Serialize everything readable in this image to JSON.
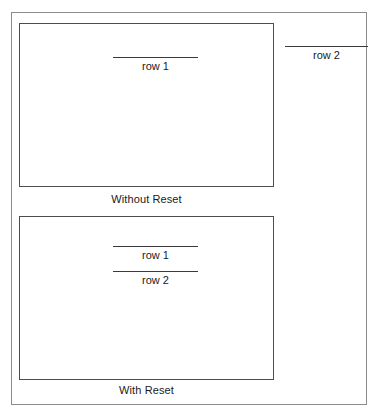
{
  "figure": {
    "panels": [
      {
        "id": "without-reset",
        "caption": "Without Reset",
        "rows_inside": [
          {
            "label": "row 1"
          }
        ],
        "rows_outside": [
          {
            "label": "row 2"
          }
        ]
      },
      {
        "id": "with-reset",
        "caption": "With Reset",
        "rows_inside": [
          {
            "label": "row 1"
          },
          {
            "label": "row 2"
          }
        ],
        "rows_outside": []
      }
    ]
  },
  "colors": {
    "background": "#ffffff",
    "outer_frame_border": "#8c8c8c",
    "panel_border": "#4d4d4d",
    "rule": "#3a3a3a",
    "text": "#1a1a1a"
  }
}
